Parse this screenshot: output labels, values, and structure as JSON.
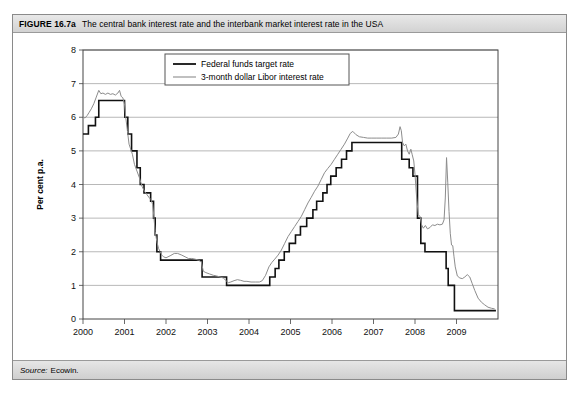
{
  "figure": {
    "number": "FIGURE 16.7a",
    "caption": "The central bank interest rate and the interbank market interest rate in the USA",
    "source_label": "Source:",
    "source_value": "Ecowin."
  },
  "chart_data": {
    "type": "line",
    "title": "The central bank interest rate and the interbank market interest rate in the USA",
    "xlabel": "",
    "ylabel": "Per cent p.a.",
    "ylim": [
      0,
      8
    ],
    "xlim": [
      2000,
      2010
    ],
    "yticks": [
      0,
      1,
      2,
      3,
      4,
      5,
      6,
      7,
      8
    ],
    "ytick_labels": [
      "0",
      "1",
      "2",
      "3",
      "4",
      "5",
      "6",
      "7",
      "8"
    ],
    "xticks": [
      2000,
      2001,
      2002,
      2003,
      2004,
      2005,
      2006,
      2007,
      2008,
      2009
    ],
    "xtick_labels": [
      "2000",
      "2001",
      "2002",
      "2003",
      "2004",
      "2005",
      "2006",
      "2007",
      "2008",
      "2009"
    ],
    "grid": "horizontal",
    "legend_position": "top-center",
    "colors": {
      "series_fed": "#111111",
      "series_libor": "#8c8c8c",
      "grid": "#9a9a9a",
      "axis": "#444444"
    },
    "series": [
      {
        "name": "Federal funds target rate",
        "style": "step",
        "color": "#111111",
        "width": 1.6,
        "points": [
          [
            2000.0,
            5.5
          ],
          [
            2000.13,
            5.5
          ],
          [
            2000.13,
            5.75
          ],
          [
            2000.3,
            5.75
          ],
          [
            2000.3,
            6.0
          ],
          [
            2000.38,
            6.0
          ],
          [
            2000.38,
            6.5
          ],
          [
            2001.0,
            6.5
          ],
          [
            2001.01,
            6.0
          ],
          [
            2001.08,
            6.0
          ],
          [
            2001.08,
            5.5
          ],
          [
            2001.17,
            5.5
          ],
          [
            2001.17,
            5.0
          ],
          [
            2001.3,
            5.0
          ],
          [
            2001.3,
            4.5
          ],
          [
            2001.38,
            4.5
          ],
          [
            2001.38,
            4.0
          ],
          [
            2001.47,
            4.0
          ],
          [
            2001.47,
            3.75
          ],
          [
            2001.63,
            3.75
          ],
          [
            2001.63,
            3.5
          ],
          [
            2001.7,
            3.5
          ],
          [
            2001.7,
            3.0
          ],
          [
            2001.74,
            3.0
          ],
          [
            2001.74,
            2.5
          ],
          [
            2001.78,
            2.5
          ],
          [
            2001.78,
            2.0
          ],
          [
            2001.87,
            2.0
          ],
          [
            2001.87,
            1.75
          ],
          [
            2002.87,
            1.75
          ],
          [
            2002.87,
            1.25
          ],
          [
            2003.46,
            1.25
          ],
          [
            2003.46,
            1.0
          ],
          [
            2004.5,
            1.0
          ],
          [
            2004.5,
            1.25
          ],
          [
            2004.63,
            1.25
          ],
          [
            2004.63,
            1.5
          ],
          [
            2004.72,
            1.5
          ],
          [
            2004.72,
            1.75
          ],
          [
            2004.85,
            1.75
          ],
          [
            2004.85,
            2.0
          ],
          [
            2004.97,
            2.0
          ],
          [
            2004.97,
            2.25
          ],
          [
            2005.12,
            2.25
          ],
          [
            2005.12,
            2.5
          ],
          [
            2005.24,
            2.5
          ],
          [
            2005.24,
            2.75
          ],
          [
            2005.39,
            2.75
          ],
          [
            2005.39,
            3.0
          ],
          [
            2005.54,
            3.0
          ],
          [
            2005.54,
            3.25
          ],
          [
            2005.63,
            3.25
          ],
          [
            2005.63,
            3.5
          ],
          [
            2005.78,
            3.5
          ],
          [
            2005.78,
            3.75
          ],
          [
            2005.88,
            3.75
          ],
          [
            2005.88,
            4.0
          ],
          [
            2005.97,
            4.0
          ],
          [
            2005.97,
            4.25
          ],
          [
            2006.1,
            4.25
          ],
          [
            2006.1,
            4.5
          ],
          [
            2006.23,
            4.5
          ],
          [
            2006.23,
            4.75
          ],
          [
            2006.35,
            4.75
          ],
          [
            2006.35,
            5.0
          ],
          [
            2006.48,
            5.0
          ],
          [
            2006.48,
            5.25
          ],
          [
            2007.68,
            5.25
          ],
          [
            2007.68,
            4.75
          ],
          [
            2007.86,
            4.75
          ],
          [
            2007.86,
            4.5
          ],
          [
            2007.95,
            4.5
          ],
          [
            2007.95,
            4.25
          ],
          [
            2008.06,
            4.25
          ],
          [
            2008.06,
            3.0
          ],
          [
            2008.14,
            3.0
          ],
          [
            2008.14,
            2.25
          ],
          [
            2008.24,
            2.25
          ],
          [
            2008.24,
            2.0
          ],
          [
            2008.75,
            2.0
          ],
          [
            2008.75,
            1.5
          ],
          [
            2008.8,
            1.5
          ],
          [
            2008.8,
            1.0
          ],
          [
            2008.95,
            1.0
          ],
          [
            2008.95,
            0.25
          ],
          [
            2009.95,
            0.25
          ]
        ]
      },
      {
        "name": "3-month dollar Libor interest rate",
        "style": "line",
        "color": "#8c8c8c",
        "width": 1.0,
        "points": [
          [
            2000.0,
            6.0
          ],
          [
            2000.05,
            5.98
          ],
          [
            2000.1,
            6.05
          ],
          [
            2000.15,
            6.15
          ],
          [
            2000.2,
            6.25
          ],
          [
            2000.26,
            6.4
          ],
          [
            2000.32,
            6.6
          ],
          [
            2000.38,
            6.8
          ],
          [
            2000.43,
            6.7
          ],
          [
            2000.48,
            6.72
          ],
          [
            2000.54,
            6.68
          ],
          [
            2000.6,
            6.72
          ],
          [
            2000.66,
            6.68
          ],
          [
            2000.72,
            6.7
          ],
          [
            2000.78,
            6.66
          ],
          [
            2000.84,
            6.72
          ],
          [
            2000.88,
            6.8
          ],
          [
            2000.92,
            6.62
          ],
          [
            2000.96,
            6.58
          ],
          [
            2001.0,
            6.4
          ],
          [
            2001.03,
            6.0
          ],
          [
            2001.07,
            5.6
          ],
          [
            2001.11,
            5.2
          ],
          [
            2001.15,
            5.05
          ],
          [
            2001.19,
            4.9
          ],
          [
            2001.24,
            4.6
          ],
          [
            2001.3,
            4.4
          ],
          [
            2001.36,
            4.2
          ],
          [
            2001.42,
            3.95
          ],
          [
            2001.48,
            3.8
          ],
          [
            2001.54,
            3.7
          ],
          [
            2001.6,
            3.6
          ],
          [
            2001.64,
            3.55
          ],
          [
            2001.68,
            3.4
          ],
          [
            2001.71,
            3.0
          ],
          [
            2001.74,
            2.6
          ],
          [
            2001.78,
            2.3
          ],
          [
            2001.82,
            2.1
          ],
          [
            2001.86,
            2.0
          ],
          [
            2001.9,
            1.9
          ],
          [
            2001.94,
            1.85
          ],
          [
            2002.0,
            1.82
          ],
          [
            2002.1,
            1.88
          ],
          [
            2002.2,
            1.95
          ],
          [
            2002.28,
            1.95
          ],
          [
            2002.38,
            1.9
          ],
          [
            2002.46,
            1.85
          ],
          [
            2002.54,
            1.8
          ],
          [
            2002.62,
            1.8
          ],
          [
            2002.7,
            1.78
          ],
          [
            2002.78,
            1.75
          ],
          [
            2002.85,
            1.7
          ],
          [
            2002.9,
            1.42
          ],
          [
            2002.96,
            1.38
          ],
          [
            2003.05,
            1.34
          ],
          [
            2003.14,
            1.3
          ],
          [
            2003.22,
            1.28
          ],
          [
            2003.3,
            1.25
          ],
          [
            2003.38,
            1.22
          ],
          [
            2003.44,
            1.15
          ],
          [
            2003.5,
            1.08
          ],
          [
            2003.56,
            1.1
          ],
          [
            2003.64,
            1.14
          ],
          [
            2003.72,
            1.17
          ],
          [
            2003.8,
            1.15
          ],
          [
            2003.88,
            1.12
          ],
          [
            2003.95,
            1.12
          ],
          [
            2004.05,
            1.1
          ],
          [
            2004.15,
            1.1
          ],
          [
            2004.25,
            1.1
          ],
          [
            2004.32,
            1.14
          ],
          [
            2004.4,
            1.3
          ],
          [
            2004.48,
            1.55
          ],
          [
            2004.55,
            1.68
          ],
          [
            2004.62,
            1.78
          ],
          [
            2004.7,
            1.9
          ],
          [
            2004.78,
            2.05
          ],
          [
            2004.86,
            2.25
          ],
          [
            2004.94,
            2.45
          ],
          [
            2005.02,
            2.6
          ],
          [
            2005.1,
            2.75
          ],
          [
            2005.18,
            2.9
          ],
          [
            2005.26,
            3.05
          ],
          [
            2005.34,
            3.25
          ],
          [
            2005.42,
            3.45
          ],
          [
            2005.5,
            3.62
          ],
          [
            2005.58,
            3.8
          ],
          [
            2005.66,
            3.95
          ],
          [
            2005.74,
            4.15
          ],
          [
            2005.82,
            4.35
          ],
          [
            2005.9,
            4.48
          ],
          [
            2005.98,
            4.6
          ],
          [
            2006.06,
            4.75
          ],
          [
            2006.14,
            4.9
          ],
          [
            2006.22,
            5.05
          ],
          [
            2006.3,
            5.2
          ],
          [
            2006.38,
            5.38
          ],
          [
            2006.44,
            5.52
          ],
          [
            2006.5,
            5.58
          ],
          [
            2006.58,
            5.48
          ],
          [
            2006.66,
            5.42
          ],
          [
            2006.76,
            5.4
          ],
          [
            2006.86,
            5.38
          ],
          [
            2006.96,
            5.38
          ],
          [
            2007.08,
            5.38
          ],
          [
            2007.2,
            5.38
          ],
          [
            2007.32,
            5.38
          ],
          [
            2007.44,
            5.38
          ],
          [
            2007.54,
            5.4
          ],
          [
            2007.6,
            5.5
          ],
          [
            2007.64,
            5.72
          ],
          [
            2007.67,
            5.6
          ],
          [
            2007.7,
            5.25
          ],
          [
            2007.74,
            5.15
          ],
          [
            2007.78,
            5.2
          ],
          [
            2007.82,
            5.0
          ],
          [
            2007.86,
            4.9
          ],
          [
            2007.9,
            5.05
          ],
          [
            2007.93,
            4.9
          ],
          [
            2007.97,
            4.7
          ],
          [
            2008.0,
            4.3
          ],
          [
            2008.04,
            3.6
          ],
          [
            2008.08,
            3.1
          ],
          [
            2008.12,
            3.05
          ],
          [
            2008.16,
            2.8
          ],
          [
            2008.2,
            2.7
          ],
          [
            2008.25,
            2.78
          ],
          [
            2008.3,
            2.68
          ],
          [
            2008.36,
            2.72
          ],
          [
            2008.42,
            2.8
          ],
          [
            2008.48,
            2.78
          ],
          [
            2008.54,
            2.82
          ],
          [
            2008.6,
            2.8
          ],
          [
            2008.66,
            2.82
          ],
          [
            2008.7,
            2.95
          ],
          [
            2008.73,
            3.6
          ],
          [
            2008.76,
            4.8
          ],
          [
            2008.79,
            4.05
          ],
          [
            2008.82,
            3.2
          ],
          [
            2008.85,
            2.55
          ],
          [
            2008.88,
            2.2
          ],
          [
            2008.91,
            2.18
          ],
          [
            2008.94,
            1.85
          ],
          [
            2008.97,
            1.55
          ],
          [
            2009.02,
            1.28
          ],
          [
            2009.08,
            1.22
          ],
          [
            2009.14,
            1.2
          ],
          [
            2009.2,
            1.25
          ],
          [
            2009.26,
            1.32
          ],
          [
            2009.32,
            1.25
          ],
          [
            2009.38,
            1.05
          ],
          [
            2009.44,
            0.85
          ],
          [
            2009.52,
            0.62
          ],
          [
            2009.6,
            0.5
          ],
          [
            2009.68,
            0.42
          ],
          [
            2009.76,
            0.35
          ],
          [
            2009.84,
            0.32
          ],
          [
            2009.92,
            0.3
          ]
        ]
      }
    ],
    "annotations": [
      {
        "text": "Libor crisis spike",
        "x": 2008.76,
        "y": 4.8,
        "visible": false
      }
    ]
  },
  "legend": {
    "items": [
      {
        "label": "Federal funds target rate",
        "color": "#111111",
        "width": 1.8
      },
      {
        "label": "3-month dollar Libor interest rate",
        "color": "#8c8c8c",
        "width": 1.1
      }
    ]
  }
}
